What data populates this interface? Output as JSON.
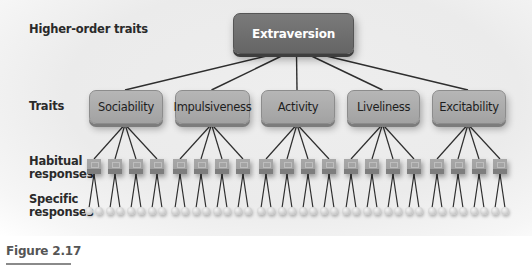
{
  "diagram": {
    "row_labels": {
      "higher_order": "Higher-order traits",
      "traits": "Traits",
      "habitual_line1": "Habitual",
      "habitual_line2": "responses",
      "specific_line1": "Specific",
      "specific_line2": "responses"
    },
    "higher_order_trait": "Extraversion",
    "traits": [
      {
        "label": "Sociability",
        "x": 89,
        "w": 72
      },
      {
        "label": "Impulsiveness",
        "x": 175,
        "w": 73
      },
      {
        "label": "Activity",
        "x": 261,
        "w": 72
      },
      {
        "label": "Liveliness",
        "x": 347,
        "w": 71
      },
      {
        "label": "Excitability",
        "x": 432,
        "w": 72
      }
    ],
    "habitual_per_trait": 4,
    "specific_per_habitual": 2,
    "colors": {
      "higher_order_box": "#6e6e6e",
      "trait_box": "#a8a8a8",
      "habitual_box": "#a0a0a0",
      "line": "#2e2e2e"
    }
  },
  "caption": {
    "figure_label": "Figure 2.17"
  }
}
